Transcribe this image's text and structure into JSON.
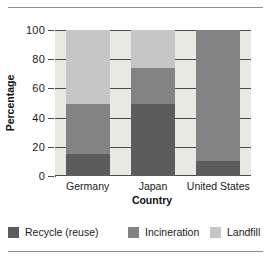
{
  "chart_data": {
    "type": "bar",
    "subtype": "stacked-bar-100-percent",
    "title": "",
    "xlabel": "Country",
    "ylabel": "Percentage",
    "categories": [
      "Germany",
      "Japan",
      "United States"
    ],
    "ylim": [
      0,
      100
    ],
    "yticks": [
      0,
      20,
      40,
      60,
      80,
      100
    ],
    "ytick_labels": [
      "0",
      "20",
      "40",
      "60",
      "80",
      "100"
    ],
    "grid": true,
    "grid_axis": "y",
    "legend_position": "bottom",
    "series": [
      {
        "name": "Recycle (reuse)",
        "color": "#5c5c5c",
        "values": [
          15,
          49,
          10
        ]
      },
      {
        "name": "Incineration",
        "color": "#838383",
        "values": [
          34,
          25,
          90
        ]
      },
      {
        "name": "Landfill",
        "color": "#c6c6c6",
        "values": [
          51,
          26,
          0
        ]
      }
    ],
    "cumulative_tops": {
      "Germany": [
        15,
        49,
        100
      ],
      "Japan": [
        49,
        74,
        100
      ],
      "United States": [
        10,
        100,
        100
      ]
    }
  },
  "colors": {
    "plot_background": "#e9e9e4",
    "axis": "#4a4a4a",
    "text": "#1a1a1a",
    "rule": "#8d8d8d",
    "recycle": "#5c5c5c",
    "incineration": "#838383",
    "landfill": "#c6c6c6"
  },
  "legend": {
    "items": [
      {
        "label": "Recycle (reuse)"
      },
      {
        "label": "Incineration"
      },
      {
        "label": "Landfill"
      }
    ]
  }
}
